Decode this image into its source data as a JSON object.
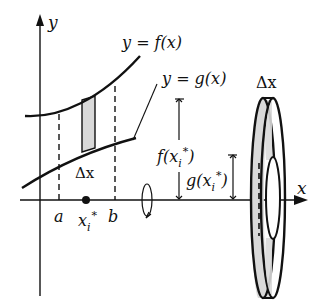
{
  "figure": {
    "type": "washer-method-diagram",
    "labels": {
      "y_axis": "y",
      "x_axis": "x",
      "upper_curve": "y = f(x)",
      "lower_curve": "y = g(x)",
      "strip_width": "Δx",
      "washer_width": "Δx",
      "outer_radius": "f(x",
      "inner_radius": "g(x",
      "sub_i": "i",
      "star": "*",
      "close": ")",
      "a": "a",
      "b": "b",
      "x_i": "x",
      "x_i_sub": "i",
      "x_i_star": "*"
    },
    "colors": {
      "ink": "#111111",
      "shade": "#d9d9d9",
      "background": "#ffffff"
    }
  }
}
